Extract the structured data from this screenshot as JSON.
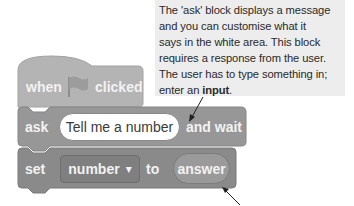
{
  "callout": {
    "line1": "The 'ask' block displays a message",
    "line2": "and you can customise what it",
    "line3": "says in the white area. This block",
    "line4": "requires a response from the user.",
    "line5": "The user has to type something in;",
    "line6_prefix": "enter an ",
    "line6_bold": "input",
    "line6_suffix": "."
  },
  "blocks": {
    "hat": {
      "when": "when",
      "icon": "green-flag-icon",
      "clicked": "clicked"
    },
    "ask": {
      "label": "ask",
      "input_value": "Tell me a number",
      "suffix": "and wait"
    },
    "set": {
      "label": "set",
      "variable": "number",
      "dropdown_glyph": "▾",
      "to": "to",
      "reporter": "answer"
    }
  },
  "colors": {
    "callout_bg": "#ededed",
    "hat_block": "#b4b4b4",
    "ask_block": "#979797",
    "set_block": "#8a8a8a"
  }
}
